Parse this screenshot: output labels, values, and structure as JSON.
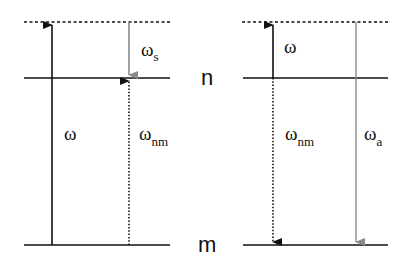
{
  "diagram": {
    "type": "energy-level diagram (Raman scattering)",
    "levels": {
      "upper_label": "n",
      "lower_label": "m"
    },
    "left_panel": {
      "pump_label": "ω",
      "stokes_label": "ω",
      "stokes_sub": "s",
      "transition_label": "ω",
      "transition_sub": "nm"
    },
    "right_panel": {
      "pump_label": "ω",
      "transition_label": "ω",
      "transition_sub": "nm",
      "antistokes_label": "ω",
      "antistokes_sub": "a"
    },
    "colors": {
      "line": "#111111",
      "gray_arrow": "#8a8a8a"
    }
  }
}
